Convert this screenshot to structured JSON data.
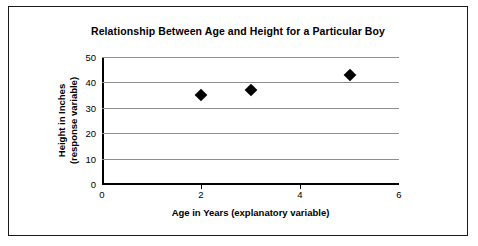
{
  "chart_data": {
    "type": "scatter",
    "title": "Relationship Between Age and Height for a Particular Boy",
    "xlabel": "Age in Years (explanatory variable)",
    "ylabel_line1": "Height in Inches",
    "ylabel_line2": "(response variable)",
    "x": [
      2,
      3,
      5
    ],
    "y": [
      35,
      37,
      43
    ],
    "xlim": [
      0,
      6
    ],
    "ylim": [
      0,
      50
    ],
    "xticks": [
      0,
      2,
      4,
      6
    ],
    "xtick_labels": [
      "0",
      "2",
      "4",
      "6"
    ],
    "yticks": [
      0,
      10,
      20,
      30,
      40,
      50
    ],
    "ytick_labels": [
      "0",
      "10",
      "20",
      "30",
      "40",
      "50"
    ],
    "grid": "horizontal",
    "legend": "none",
    "marker": "diamond",
    "marker_color": "#000000",
    "gridline_color": "#8e8e8e",
    "axis_color": "#000000",
    "background": "#ffffff"
  }
}
